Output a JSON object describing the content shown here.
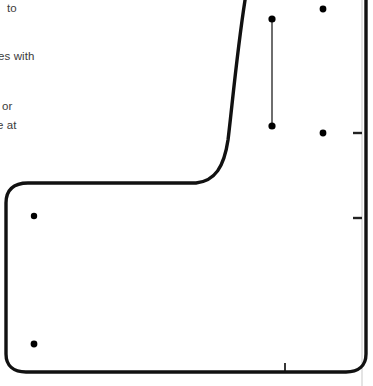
{
  "figure": {
    "title_visible": false,
    "background_color": "#ffffff",
    "width": 373,
    "height": 386
  },
  "annotations": [
    {
      "id": "ann-0",
      "text": "to",
      "x": 7,
      "y": 2,
      "truncated_left": true
    },
    {
      "id": "ann-1",
      "text": "es with",
      "x": -2,
      "y": 50,
      "truncated_left": true
    },
    {
      "id": "ann-2",
      "text": "or",
      "x": 2,
      "y": 100,
      "truncated_left": true
    },
    {
      "id": "ann-3",
      "text": "e at",
      "x": -3,
      "y": 119,
      "truncated_left": true
    }
  ],
  "chart_data": {
    "type": "scatter",
    "title": "",
    "xlabel": "",
    "ylabel": "",
    "xlim": [
      0,
      373
    ],
    "ylim": [
      386,
      0
    ],
    "grid": false,
    "legend": "none",
    "note": "Coordinates are given in pixel space of the cropped screenshot; the underlying axes labels are outside the crop.",
    "colors": {
      "curve": "#111111",
      "point": "#000000",
      "errorbar": "#4a4a4a",
      "axis": "#c9c9c9",
      "tick": "#222222",
      "text": "#3b3b3b"
    },
    "points": [
      {
        "name": "point-upper-left",
        "x": 34,
        "y": 216
      },
      {
        "name": "point-lower-left",
        "x": 34,
        "y": 344
      },
      {
        "name": "errorbar-top-cap",
        "x": 272,
        "y": 19
      },
      {
        "name": "errorbar-bottom-cap",
        "x": 272,
        "y": 126
      },
      {
        "name": "point-upper-right",
        "x": 323,
        "y": 9
      },
      {
        "name": "point-lower-right",
        "x": 323,
        "y": 133
      }
    ],
    "errorbars": [
      {
        "name": "errorbar-vertical",
        "x": 272,
        "y_top": 19,
        "y_bottom": 126,
        "length": 107
      }
    ],
    "curve": {
      "name": "rounded-boundary-curve",
      "stroke_width": 3.4,
      "corner_radius": 22,
      "path": "M 247 -12 C 238 40 232 108 228 140 C 224 167 215 181 196 183 L 28 183 C 13 183 6 190 6 203 L 6 354 C 6 366 14 372 26 372 L 346 372 C 358 372 366 366 366 354 L 366 -12"
    },
    "axes": [
      {
        "name": "right-vertical-axis",
        "orientation": "vertical",
        "x": 362,
        "y_start": 0,
        "y_end": 386,
        "ticks": [
          {
            "name": "right-tick-upper",
            "y": 133,
            "length": 9
          },
          {
            "name": "right-tick-lower",
            "y": 218,
            "length": 9
          }
        ]
      },
      {
        "name": "bottom-horizontal-axis",
        "orientation": "horizontal",
        "y": 372,
        "x_start": 0,
        "x_end": 373,
        "ticks": [
          {
            "name": "bottom-tick-1",
            "x": 285,
            "length": 9
          }
        ]
      }
    ]
  }
}
